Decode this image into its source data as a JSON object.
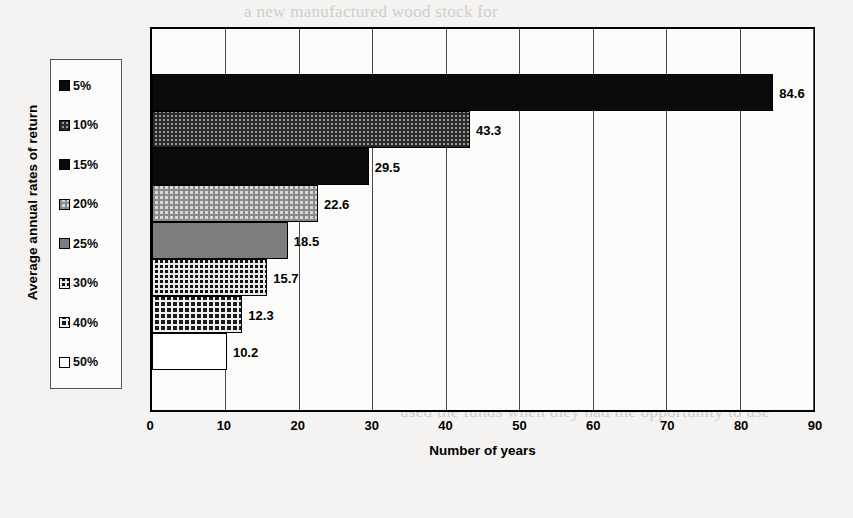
{
  "chart_data": {
    "type": "bar",
    "orientation": "horizontal",
    "title": "",
    "xlabel": "Number of years",
    "ylabel": "Average annual rates of return",
    "categories": [
      "5%",
      "10%",
      "15%",
      "20%",
      "25%",
      "30%",
      "40%",
      "50%"
    ],
    "values": [
      84.6,
      43.3,
      29.5,
      22.6,
      18.5,
      15.7,
      12.3,
      10.2
    ],
    "value_labels": [
      "84.6",
      "43.3",
      "29.5",
      "22.6",
      "18.5",
      "15.7",
      "12.3",
      "10.2"
    ],
    "xlim": [
      0,
      90
    ],
    "xticks": [
      0,
      10,
      20,
      30,
      40,
      50,
      60,
      70,
      80,
      90
    ],
    "xtick_labels": [
      "0",
      "10",
      "20",
      "30",
      "40",
      "50",
      "60",
      "70",
      "80",
      "90"
    ],
    "grid": "vertical",
    "legend_position": "left-outside",
    "bars": [
      {
        "category": "5%",
        "value": 84.6,
        "label": "84.6",
        "pattern": "solid-black"
      },
      {
        "category": "10%",
        "value": 43.3,
        "label": "43.3",
        "pattern": "dot-gray"
      },
      {
        "category": "15%",
        "value": 29.5,
        "label": "29.5",
        "pattern": "solid-black"
      },
      {
        "category": "20%",
        "value": 22.6,
        "label": "22.6",
        "pattern": "check-light"
      },
      {
        "category": "25%",
        "value": 18.5,
        "label": "18.5",
        "pattern": "solid-gray"
      },
      {
        "category": "30%",
        "value": 15.7,
        "label": "15.7",
        "pattern": "dot-dark"
      },
      {
        "category": "40%",
        "value": 12.3,
        "label": "12.3",
        "pattern": "dot-dark2"
      },
      {
        "category": "50%",
        "value": 10.2,
        "label": "10.2",
        "pattern": "white"
      }
    ]
  },
  "legend": {
    "items": [
      {
        "label": "5%",
        "pattern": "solid-black"
      },
      {
        "label": "10%",
        "pattern": "dot-gray"
      },
      {
        "label": "15%",
        "pattern": "solid-black"
      },
      {
        "label": "20%",
        "pattern": "check-light"
      },
      {
        "label": "25%",
        "pattern": "solid-gray"
      },
      {
        "label": "30%",
        "pattern": "dot-dark"
      },
      {
        "label": "40%",
        "pattern": "dot-dark2"
      },
      {
        "label": "50%",
        "pattern": "white"
      }
    ]
  },
  "axes": {
    "x_title": "Number of years",
    "y_title": "Average annual rates of return",
    "x_ticks": [
      "0",
      "10",
      "20",
      "30",
      "40",
      "50",
      "60",
      "70",
      "80",
      "90"
    ]
  },
  "colors": {
    "ink": "#000000",
    "paper": "#f4f3f1",
    "plot_background": "#fbfbfa",
    "gray_fill": "#7d7d7d",
    "bleed_text": "#c9c7c4"
  },
  "background_text": {
    "lines": [
      {
        "text": "a new manufactured wood stock for",
        "x": 244,
        "y": 2
      },
      {
        "text": "Economic effects of",
        "x": 470,
        "y": 121
      },
      {
        "text": "buildings in Swedesboro",
        "x": 430,
        "y": 141
      },
      {
        "text": "Year 1 for the rate of return is given as",
        "x": 430,
        "y": 224
      },
      {
        "text": "Number of years required for the investment",
        "x": 415,
        "y": 245
      },
      {
        "text": "above. This is one of the equations used to make",
        "x": 400,
        "y": 265
      },
      {
        "text": "A rate of return on the invested capital in any year",
        "x": 400,
        "y": 304
      },
      {
        "text": "is what the return is in that year",
        "x": 424,
        "y": 324
      },
      {
        "text": "When the return of a project, several people have used",
        "x": 390,
        "y": 344
      },
      {
        "text": "If an important question is asked, how has a particular firm",
        "x": 376,
        "y": 382
      },
      {
        "text": "used the funds when they had the opportunity to use",
        "x": 400,
        "y": 402
      }
    ]
  }
}
